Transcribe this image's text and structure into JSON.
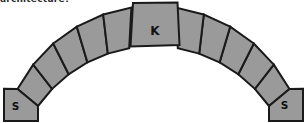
{
  "page": {
    "background": "#ffffff"
  },
  "caption_fragment": {
    "text": "architecture?"
  },
  "diagram": {
    "type": "masonry-arch",
    "keystone": {
      "label": "K"
    },
    "left_springer": {
      "label": "S"
    },
    "right_springer": {
      "label": "S"
    },
    "voussoirs_per_side": 5,
    "colors": {
      "block_fill": "#9a9a9a",
      "block_outline": "#1a1a1a"
    }
  }
}
